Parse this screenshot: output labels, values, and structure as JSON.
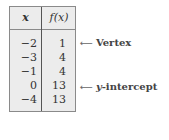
{
  "table": {
    "headers": {
      "x": "x",
      "fx": "f(x)"
    },
    "rows": [
      {
        "x": "−2",
        "fx": "1"
      },
      {
        "x": "−3",
        "fx": "4"
      },
      {
        "x": "−1",
        "fx": "4"
      },
      {
        "x": "0",
        "fx": "13"
      },
      {
        "x": "−4",
        "fx": "13"
      }
    ]
  },
  "annotations": {
    "vertex": {
      "arrow": "⟵",
      "label": "Vertex"
    },
    "intercept": {
      "arrow": "⟵",
      "prefix": "y",
      "label": "-intercept"
    }
  }
}
